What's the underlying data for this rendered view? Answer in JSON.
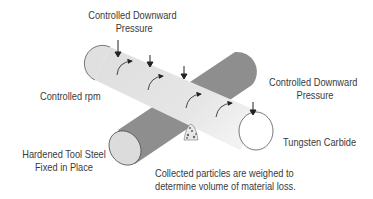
{
  "diagram": {
    "labels": {
      "top_pressure_line1": "Controlled Downward",
      "top_pressure_line2": "Pressure",
      "right_pressure_line1": "Controlled Downward",
      "right_pressure_line2": "Pressure",
      "rpm": "Controlled rpm",
      "tool_steel_line1": "Hardened Tool Steel",
      "tool_steel_line2": "Fixed in Place",
      "tungsten": "Tungsten Carbide",
      "particles_line1": "Collected particles are weighed to",
      "particles_line2": "determine volume of material loss."
    },
    "components": {
      "rotating_cylinder": {
        "material": "Tungsten Carbide",
        "color": "#e2e2e2"
      },
      "fixed_cylinder": {
        "material": "Hardened Tool Steel",
        "color": "#8e8e8e"
      },
      "particles": "collected-particles-pile"
    },
    "colors": {
      "text": "#3a3a3a",
      "outline": "#555555",
      "light_body": "#e2e2e2",
      "dark_body": "#8e8e8e"
    }
  }
}
